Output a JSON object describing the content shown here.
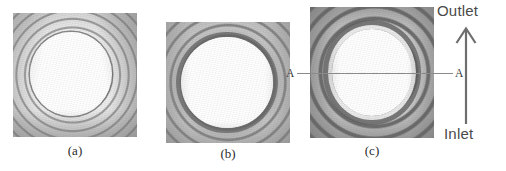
{
  "figure": {
    "panels": [
      {
        "id": "a",
        "caption": "(a)",
        "description": "interferogram-thin-concentric-fringes"
      },
      {
        "id": "b",
        "caption": "(b)",
        "description": "interferogram-bright-core-single-dark-ring"
      },
      {
        "id": "c",
        "caption": "(c)",
        "description": "interferogram-thick-high-contrast-fringes"
      }
    ],
    "section": {
      "left_label": "A",
      "right_label": "A"
    },
    "flow": {
      "outlet_label": "Outlet",
      "inlet_label": "Inlet",
      "direction": "up"
    },
    "colors": {
      "background": "#ffffff",
      "caption_text": "#2b2b2b",
      "flow_text": "#4a4a4a",
      "section_line": "#8a8a8a",
      "arrow": "#6e6e6e"
    }
  }
}
